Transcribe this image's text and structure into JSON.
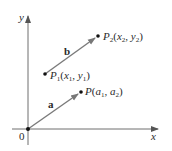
{
  "diagram": {
    "axes": {
      "x_label": "x",
      "y_label": "y",
      "origin_label": "0",
      "color": "#6e6e6e"
    },
    "vectors": [
      {
        "name": "a",
        "label": "a",
        "from": "O",
        "to": "P",
        "color": "#7a7a7a"
      },
      {
        "name": "b",
        "label": "b",
        "from": "P1",
        "to": "P2",
        "color": "#7a7a7a"
      }
    ],
    "points": {
      "P": {
        "name": "P",
        "open": "(",
        "c1": "a",
        "s1": "1",
        "sep": ", ",
        "c2": "a",
        "s2": "2",
        "close": ")"
      },
      "P1": {
        "name": "P",
        "sub": "1",
        "open": "(",
        "c1": "x",
        "s1": "1",
        "sep": ", ",
        "c2": "y",
        "s2": "1",
        "close": ")"
      },
      "P2": {
        "name": "P",
        "sub": "2",
        "open": "(",
        "c1": "x",
        "s1": "2",
        "sep": ", ",
        "c2": "y",
        "s2": "2",
        "close": ")"
      }
    },
    "point_color": "#111111"
  }
}
